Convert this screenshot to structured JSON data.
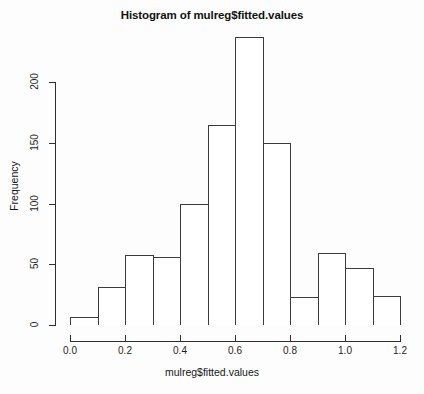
{
  "chart_data": {
    "type": "bar",
    "title": "Histogram of mulreg$fitted.values",
    "xlabel": "mulreg$fitted.values",
    "ylabel": "Frequency",
    "bin_width": 0.1,
    "bin_edges": [
      0.0,
      0.1,
      0.2,
      0.3,
      0.4,
      0.5,
      0.6,
      0.7,
      0.8,
      0.9,
      1.0,
      1.1,
      1.2
    ],
    "categories": [
      "0.0-0.1",
      "0.1-0.2",
      "0.2-0.3",
      "0.3-0.4",
      "0.4-0.5",
      "0.5-0.6",
      "0.6-0.7",
      "0.7-0.8",
      "0.8-0.9",
      "0.9-1.0",
      "1.0-1.1",
      "1.1-1.2"
    ],
    "values": [
      7,
      31,
      58,
      56,
      100,
      165,
      237,
      150,
      23,
      59,
      47,
      24
    ],
    "xlim": [
      0.0,
      1.2
    ],
    "ylim": [
      0,
      240
    ],
    "xticks": [
      0.0,
      0.2,
      0.4,
      0.6,
      0.8,
      1.0,
      1.2
    ],
    "xtick_labels": [
      "0.0",
      "0.2",
      "0.4",
      "0.6",
      "0.8",
      "1.0",
      "1.2"
    ],
    "yticks": [
      0,
      50,
      100,
      150,
      200
    ],
    "ytick_labels": [
      "0",
      "50",
      "100",
      "150",
      "200"
    ],
    "grid": false,
    "legend": false,
    "bar_fill_color": "#ffffff",
    "bar_border_color": "#3c3c3c",
    "axis_color": "#2e2e2e",
    "background_color": "#fdfdfd"
  }
}
